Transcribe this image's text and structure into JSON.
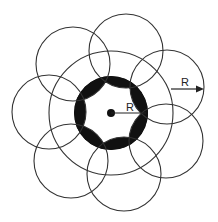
{
  "diagram": {
    "colors": {
      "stroke": "#333333",
      "fill": "#111111",
      "background": "#ffffff"
    },
    "labels": {
      "inner_radius": "R",
      "outer_radius": "R"
    },
    "center": {
      "x": 111,
      "y": 113
    },
    "big_circle_radius": 62,
    "ring_outer_radius": 37,
    "small_circle_radius": 37,
    "small_circle_count": 7
  }
}
